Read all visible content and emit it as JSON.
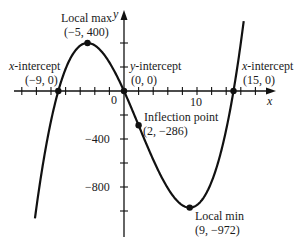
{
  "chart_data": {
    "type": "line",
    "title": "",
    "function": "f(x) = x^3 - 6x^2 - 135x",
    "xlabel": "x",
    "ylabel": "y",
    "xlim": [
      -12.2,
      16.4
    ],
    "ylim": [
      -1200,
      590
    ],
    "x_tick_step": 2,
    "y_tick_step": 200,
    "x_tick_labels": [
      {
        "value": 0,
        "label": "0"
      },
      {
        "value": 10,
        "label": "10"
      }
    ],
    "y_tick_labels": [
      {
        "value": -400,
        "label": "−400"
      },
      {
        "value": -800,
        "label": "−800"
      }
    ],
    "grid": false,
    "legend": null,
    "key_points": [
      {
        "name": "Local max",
        "x": -5,
        "y": 400,
        "label": "(−5, 400)"
      },
      {
        "name": "x-intercept",
        "x": -9,
        "y": 0,
        "label": "(−9, 0)"
      },
      {
        "name": "y-intercept",
        "x": 0,
        "y": 0,
        "label": "(0, 0)"
      },
      {
        "name": "Inflection point",
        "x": 2,
        "y": -286,
        "label": "(2, −286)"
      },
      {
        "name": "Local min",
        "x": 9,
        "y": -972,
        "label": "(9, −972)"
      },
      {
        "name": "x-intercept",
        "x": 15,
        "y": 0,
        "label": "(15, 0)"
      }
    ]
  },
  "labels": {
    "local_max_title": "Local max",
    "local_max_coords": "(−5, 400)",
    "x_int_left_title_var": "x",
    "x_int_left_title_rest": "-intercept",
    "x_int_left_coords": "(−9, 0)",
    "y_int_title_var": "y",
    "y_int_title_rest": "-intercept",
    "y_int_coords": "(0, 0)",
    "inflection_title": "Inflection point",
    "inflection_coords": "(2, −286)",
    "local_min_title": "Local min",
    "local_min_coords": "(9, −972)",
    "x_int_right_title_var": "x",
    "x_int_right_title_rest": "-intercept",
    "x_int_right_coords": "(15, 0)",
    "origin": "0",
    "x_tick_10": "10",
    "y_tick_m400": "−400",
    "y_tick_m800": "−800",
    "x_axis_label": "x",
    "y_axis_label": "y"
  },
  "colors": {
    "curve": "#111111",
    "axes": "#111111",
    "background": "#ffffff"
  }
}
